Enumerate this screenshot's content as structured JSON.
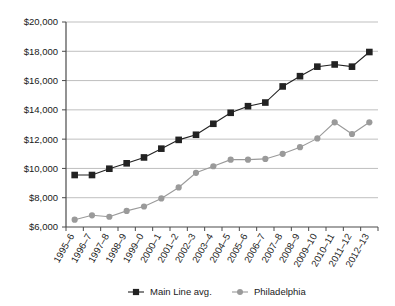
{
  "chart_data": {
    "type": "line",
    "title": "",
    "xlabel": "",
    "ylabel": "",
    "grid": true,
    "legend_position": "bottom",
    "ylim": [
      6000,
      20000
    ],
    "ytick_step": 2000,
    "ytick_labels": [
      "$6,000",
      "$8,000",
      "$10,000",
      "$12,000",
      "$14,000",
      "$16,000",
      "$18,000",
      "$20,000"
    ],
    "ytick_values": [
      6000,
      8000,
      10000,
      12000,
      14000,
      16000,
      18000,
      20000
    ],
    "categories": [
      "1995–6",
      "1996–7",
      "1997–8",
      "1998–9",
      "1999–0",
      "2000–1",
      "2001–2",
      "2002–3",
      "2003–4",
      "2004–5",
      "2005–6",
      "2006–7",
      "2007–8",
      "2008–9",
      "2009–10",
      "2010–11",
      "2011–12",
      "2012–13"
    ],
    "series": [
      {
        "name": "Main Line avg.",
        "color": "#222222",
        "marker": "square",
        "values": [
          9550,
          9550,
          9980,
          10350,
          10750,
          11350,
          11950,
          12300,
          13050,
          13800,
          14250,
          14500,
          15600,
          16300,
          16950,
          17100,
          16950,
          17950
        ]
      },
      {
        "name": "Philadelphia",
        "color": "#9a9a9a",
        "marker": "circle",
        "values": [
          6500,
          6800,
          6700,
          7100,
          7400,
          7950,
          8700,
          9700,
          10150,
          10600,
          10600,
          10650,
          11000,
          11450,
          12050,
          13150,
          12350,
          13150
        ]
      }
    ]
  },
  "legend": {
    "items": [
      {
        "label": "Main Line avg."
      },
      {
        "label": "Philadelphia"
      }
    ]
  }
}
